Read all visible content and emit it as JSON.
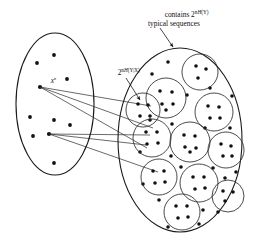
{
  "figure": {
    "kind": "information-theory-joint-typicality-diagram",
    "width": 257,
    "height": 240,
    "background_color": "#ffffff",
    "stroke_color": "#1a1a1a",
    "dot_color": "#111111"
  },
  "labels": {
    "top_annotation": {
      "line1_prefix": "contains 2",
      "line1_exponent_n": "n",
      "line1_exponent_h": "H",
      "line1_exponent_arg": "(Y)",
      "line2": "typical sequences",
      "full_text": "contains 2^{nH(Y)} typical sequences",
      "x": 148,
      "y": 16
    },
    "inner_annotation": {
      "prefix": "2",
      "exponent_n": "n",
      "exponent_h": "H",
      "exponent_arg": "(Y|X)",
      "full_text": "2^{nH(Y|X)}",
      "x": 101,
      "y": 72
    },
    "source_point": {
      "base": "x",
      "exponent": "n",
      "full_text": "x^n",
      "x": 36,
      "y": 81
    }
  },
  "left_ellipse": {
    "name": "input-typical-set",
    "cx": 55,
    "cy": 104,
    "rx": 39,
    "ry": 71,
    "dots": [
      {
        "x": 54,
        "y": 55
      },
      {
        "x": 37,
        "y": 63
      },
      {
        "x": 67,
        "y": 79
      },
      {
        "x": 40,
        "y": 87
      },
      {
        "x": 30,
        "y": 117
      },
      {
        "x": 54,
        "y": 120
      },
      {
        "x": 70,
        "y": 125
      },
      {
        "x": 33,
        "y": 136
      },
      {
        "x": 49,
        "y": 134
      },
      {
        "x": 54,
        "y": 163
      }
    ],
    "source_dots": [
      {
        "x": 40,
        "y": 87,
        "name": "source-dot-upper"
      },
      {
        "x": 49,
        "y": 134,
        "name": "source-dot-lower"
      }
    ]
  },
  "right_ellipse": {
    "name": "output-typical-set",
    "cx": 180,
    "cy": 140,
    "rx": 62,
    "ry": 92,
    "circles": [
      {
        "cx": 200,
        "cy": 72,
        "r": 18,
        "dots": [
          [
            196,
            66
          ],
          [
            206,
            69
          ],
          [
            198,
            78
          ]
        ]
      },
      {
        "cx": 166,
        "cy": 98,
        "r": 20,
        "dots": [
          [
            160,
            91
          ],
          [
            172,
            92
          ],
          [
            162,
            104
          ],
          [
            173,
            104
          ],
          [
            166,
            110
          ]
        ]
      },
      {
        "cx": 214,
        "cy": 112,
        "r": 19,
        "dots": [
          [
            208,
            106
          ],
          [
            219,
            107
          ],
          [
            210,
            118
          ],
          [
            220,
            118
          ]
        ]
      },
      {
        "cx": 152,
        "cy": 138,
        "r": 19,
        "dots": [
          [
            146,
            132
          ],
          [
            157,
            132
          ],
          [
            147,
            144
          ],
          [
            158,
            143
          ]
        ]
      },
      {
        "cx": 190,
        "cy": 142,
        "r": 20,
        "dots": [
          [
            184,
            135
          ],
          [
            195,
            136
          ],
          [
            185,
            147
          ],
          [
            196,
            148
          ],
          [
            190,
            152
          ]
        ]
      },
      {
        "cx": 226,
        "cy": 150,
        "r": 18,
        "dots": [
          [
            221,
            144
          ],
          [
            231,
            146
          ],
          [
            223,
            156
          ],
          [
            232,
            156
          ]
        ]
      },
      {
        "cx": 159,
        "cy": 177,
        "r": 18,
        "dots": [
          [
            153,
            171
          ],
          [
            164,
            171
          ],
          [
            155,
            183
          ],
          [
            165,
            182
          ]
        ]
      },
      {
        "cx": 199,
        "cy": 183,
        "r": 19,
        "dots": [
          [
            193,
            177
          ],
          [
            204,
            177
          ],
          [
            195,
            189
          ],
          [
            205,
            188
          ]
        ]
      },
      {
        "cx": 228,
        "cy": 196,
        "r": 16,
        "dots": [
          [
            223,
            191
          ],
          [
            233,
            192
          ],
          [
            225,
            201
          ]
        ]
      },
      {
        "cx": 182,
        "cy": 212,
        "r": 18,
        "dots": [
          [
            176,
            206
          ],
          [
            187,
            206
          ],
          [
            178,
            218
          ],
          [
            188,
            217
          ]
        ]
      },
      {
        "cx": 143,
        "cy": 110,
        "r": 17,
        "dots": [
          [
            138,
            104
          ],
          [
            148,
            105
          ],
          [
            140,
            116
          ],
          [
            150,
            116
          ]
        ]
      }
    ],
    "loose_dots": [
      [
        168,
        62
      ],
      [
        187,
        95
      ],
      [
        150,
        120
      ],
      [
        210,
        88
      ],
      [
        232,
        96
      ],
      [
        172,
        124
      ],
      [
        205,
        128
      ],
      [
        230,
        128
      ],
      [
        140,
        152
      ],
      [
        171,
        156
      ],
      [
        213,
        168
      ],
      [
        236,
        172
      ],
      [
        143,
        184
      ],
      [
        181,
        167
      ],
      [
        218,
        212
      ],
      [
        203,
        210
      ],
      [
        159,
        200
      ],
      [
        228,
        120
      ],
      [
        152,
        74
      ],
      [
        225,
        178
      ],
      [
        168,
        227
      ],
      [
        199,
        224
      ]
    ]
  },
  "fan_lines": {
    "name": "channel-transition-lines",
    "upper_source": [
      {
        "x1": 40,
        "y1": 87,
        "x2": 151,
        "y2": 106
      },
      {
        "x1": 40,
        "y1": 87,
        "x2": 153,
        "y2": 128
      },
      {
        "x1": 40,
        "y1": 87,
        "x2": 147,
        "y2": 148
      }
    ],
    "lower_source": [
      {
        "x1": 49,
        "y1": 134,
        "x2": 150,
        "y2": 135
      },
      {
        "x1": 49,
        "y1": 134,
        "x2": 146,
        "y2": 145
      },
      {
        "x1": 49,
        "y1": 134,
        "x2": 158,
        "y2": 172
      }
    ]
  },
  "pointers": {
    "top_pointer": {
      "x1": 160,
      "y1": 28,
      "x2": 173,
      "y2": 47,
      "name": "top-annotation-arrow"
    },
    "inner_pointer": {
      "x1": 126,
      "y1": 78,
      "x2": 141,
      "y2": 100,
      "name": "inner-annotation-arrow"
    }
  }
}
